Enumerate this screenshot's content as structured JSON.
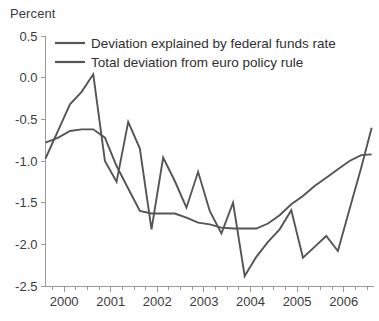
{
  "chart_data": {
    "type": "line",
    "title": "",
    "ylabel": "Percent",
    "xlabel": "",
    "ylim": [
      -2.5,
      0.5
    ],
    "yticks": [
      0.5,
      0.0,
      -0.5,
      -1.0,
      -1.5,
      -2.0,
      -2.5
    ],
    "ytick_labels": [
      "0.5",
      "0.0",
      "-0.5",
      "-1.0",
      "-1.5",
      "-2.0",
      "-2.5"
    ],
    "xlim": [
      1999.6,
      2006.65
    ],
    "xticks": [
      2000,
      2001,
      2002,
      2003,
      2004,
      2005,
      2006
    ],
    "xtick_labels": [
      "2000",
      "2001",
      "2002",
      "2003",
      "2004",
      "2005",
      "2006"
    ],
    "minor_xtick_interval": 0.25,
    "grid": false,
    "legend_position": "top-left-inside",
    "line_color": "#555555",
    "axis_color": "#9a9a9a",
    "background": "#ffffff",
    "x": [
      1999.6,
      1999.875,
      2000.125,
      2000.375,
      2000.625,
      2000.875,
      2001.125,
      2001.375,
      2001.625,
      2001.875,
      2002.125,
      2002.375,
      2002.625,
      2002.875,
      2003.125,
      2003.375,
      2003.625,
      2003.875,
      2004.125,
      2004.375,
      2004.625,
      2004.875,
      2005.125,
      2005.375,
      2005.625,
      2005.875,
      2006.125,
      2006.375,
      2006.6
    ],
    "series": [
      {
        "name": "Deviation explained by federal funds rate",
        "values": [
          -0.78,
          -0.72,
          -0.64,
          -0.62,
          -0.62,
          -0.72,
          -1.06,
          -1.33,
          -1.6,
          -1.63,
          -1.63,
          -1.63,
          -1.68,
          -1.74,
          -1.76,
          -1.8,
          -1.81,
          -1.81,
          -1.81,
          -1.75,
          -1.65,
          -1.52,
          -1.42,
          -1.3,
          -1.2,
          -1.1,
          -1.0,
          -0.93,
          -0.92
        ]
      },
      {
        "name": "Total deviation from euro policy rule",
        "values": [
          -0.97,
          -0.63,
          -0.32,
          -0.17,
          0.04,
          -1.0,
          -1.25,
          -0.53,
          -0.85,
          -1.82,
          -0.96,
          -1.24,
          -1.56,
          -1.13,
          -1.6,
          -1.87,
          -1.5,
          -2.38,
          -2.15,
          -1.97,
          -1.82,
          -1.59,
          -2.16,
          -2.03,
          -1.9,
          -2.08,
          -1.58,
          -1.08,
          -0.6
        ]
      }
    ]
  },
  "legend": {
    "items": [
      {
        "label": "Deviation explained by federal funds rate"
      },
      {
        "label": "Total deviation from euro policy rule"
      }
    ]
  }
}
